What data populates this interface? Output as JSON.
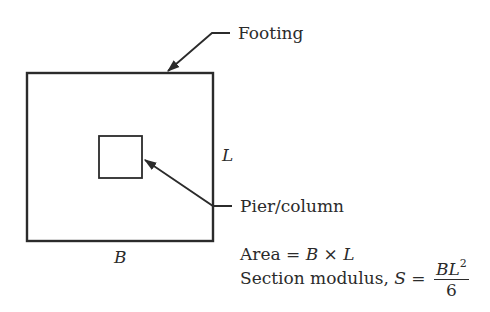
{
  "labels": {
    "footing": "Footing",
    "pier": "Pier/column",
    "dim_b": "B",
    "dim_l": "L"
  },
  "formulas": {
    "area_prefix": "Area = ",
    "area_b": "B",
    "area_times": " × ",
    "area_l": "L",
    "section_prefix": "Section modulus, ",
    "section_s": "S",
    "section_eq": " = ",
    "numerator": "BL",
    "exponent": "2",
    "denominator": "6"
  },
  "colors": {
    "line": "#2b2b2b",
    "background": "#ffffff"
  }
}
